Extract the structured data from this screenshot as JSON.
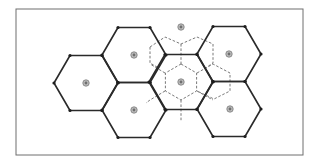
{
  "diagram": {
    "type": "hexagonal-cell-layout",
    "frame": {
      "x": 16,
      "y": 9,
      "width": 287,
      "height": 146
    },
    "colors": {
      "cell_stroke": "#2a2a2a",
      "vertex_fill": "#1e1e1e",
      "dashed_stroke": "#6a6a6a",
      "site_fill": "#bdbdbd",
      "frame_stroke": "#6e6e6e"
    },
    "cell_geometry": {
      "radius": 32,
      "half_height": 27.5,
      "orientation": "flat-top"
    },
    "solid_cells": [
      {
        "id": "cell-left",
        "cx": 86,
        "cy": 83
      },
      {
        "id": "cell-upper-mid",
        "cx": 134,
        "cy": 55
      },
      {
        "id": "cell-lower-mid",
        "cx": 134,
        "cy": 110
      },
      {
        "id": "cell-center",
        "cx": 181,
        "cy": 82
      },
      {
        "id": "cell-upper-right",
        "cx": 229,
        "cy": 54
      },
      {
        "id": "cell-lower-right",
        "cx": 229,
        "cy": 109
      }
    ],
    "sites": [
      {
        "id": "site-left",
        "cx": 86,
        "cy": 83
      },
      {
        "id": "site-upper-mid",
        "cx": 134,
        "cy": 55
      },
      {
        "id": "site-lower-mid",
        "cx": 134,
        "cy": 110
      },
      {
        "id": "site-center",
        "cx": 181,
        "cy": 82
      },
      {
        "id": "site-top",
        "cx": 181,
        "cy": 27
      },
      {
        "id": "site-upper-right",
        "cx": 229,
        "cy": 54
      },
      {
        "id": "site-lower-right",
        "cx": 230,
        "cy": 109
      }
    ],
    "dashed_inner_hex": {
      "cx": 181,
      "cy": 82,
      "radius": 18,
      "orientation": "pointy-top"
    },
    "dashed_paths": [
      "M150,47 L165,37 L181,44 L197,37 L213,44",
      "M150,47 L150,63 L157,67",
      "M213,44 L213,63 L207,67",
      "M181,44 L181,64",
      "M197,73 L213,64 L230,73 L230,91 L214,99 L197,91",
      "M165,73 L150,64",
      "M165,91 L150,100 L146,103",
      "M181,100 L181,121",
      "M197,91 L213,100"
    ]
  }
}
